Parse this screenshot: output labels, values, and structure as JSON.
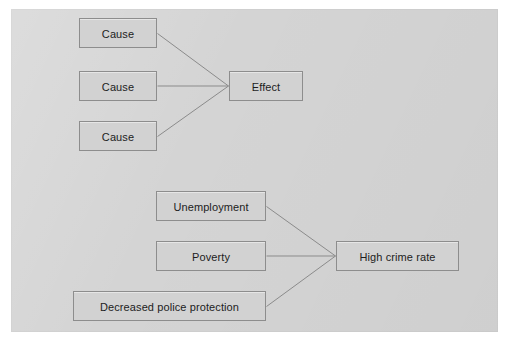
{
  "page": {
    "background_color": "#ffffff",
    "panel_color": "#d4d4d4",
    "node_fill_color": "#d2d2d2",
    "node_border_color": "#8d8d8d",
    "line_color": "#8b8b8b",
    "text_color": "#1d1d1d"
  },
  "diagrams": [
    {
      "id": "generic-cause-effect",
      "name": "Generic cause and effect template",
      "causes": [
        {
          "id": "cause-1",
          "label": "Cause"
        },
        {
          "id": "cause-2",
          "label": "Cause"
        },
        {
          "id": "cause-3",
          "label": "Cause"
        }
      ],
      "effect": {
        "id": "effect",
        "label": "Effect"
      },
      "edges": [
        {
          "from": "cause-1",
          "to": "effect"
        },
        {
          "from": "cause-2",
          "to": "effect"
        },
        {
          "from": "cause-3",
          "to": "effect"
        }
      ]
    },
    {
      "id": "crime-cause-effect",
      "name": "High crime rate example",
      "causes": [
        {
          "id": "unemployment",
          "label": "Unemployment"
        },
        {
          "id": "poverty",
          "label": "Poverty"
        },
        {
          "id": "police",
          "label": "Decreased police protection"
        }
      ],
      "effect": {
        "id": "crime",
        "label": "High crime rate"
      },
      "edges": [
        {
          "from": "unemployment",
          "to": "crime"
        },
        {
          "from": "poverty",
          "to": "crime"
        },
        {
          "from": "police",
          "to": "crime"
        }
      ]
    }
  ]
}
